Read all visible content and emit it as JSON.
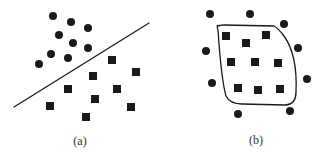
{
  "colors": {
    "ink": "#1a1a1a",
    "background": "#ffffff",
    "caption": "#333333"
  },
  "panels": [
    {
      "id": "a",
      "caption": "(a)",
      "caption_pos": [
        80,
        142
      ],
      "description": "Linearly separable classes: circles above a straight decision line, squares below",
      "separator": {
        "type": "line",
        "x1": 14,
        "y1": 107,
        "x2": 149,
        "y2": 23
      },
      "circles": [
        [
          53,
          16
        ],
        [
          71,
          22
        ],
        [
          88,
          28
        ],
        [
          59,
          35
        ],
        [
          73,
          43
        ],
        [
          88,
          48
        ],
        [
          51,
          54
        ],
        [
          68,
          58
        ],
        [
          39,
          64
        ]
      ],
      "squares": [
        [
          112,
          60
        ],
        [
          136,
          72
        ],
        [
          93,
          76
        ],
        [
          68,
          89
        ],
        [
          117,
          89
        ],
        [
          95,
          99
        ],
        [
          50,
          106
        ],
        [
          131,
          107
        ],
        [
          86,
          117
        ]
      ]
    },
    {
      "id": "b",
      "caption": "(b)",
      "caption_pos": [
        256,
        141
      ],
      "description": "Non-linearly separable classes: squares enclosed by a closed curved boundary, circles surrounding outside",
      "separator": {
        "type": "closed-curve",
        "path": "M 219 26 Q 216 24 218 30 C 220 60 222 82 226 96 Q 230 104 242 104 L 286 105 Q 296 104 296 92 C 297 70 294 50 284 36 Q 278 28 274 26 L 224 25 Q 219 25 219 26 Z"
      },
      "circles": [
        [
          210,
          14
        ],
        [
          250,
          14
        ],
        [
          284,
          24
        ],
        [
          206,
          51
        ],
        [
          298,
          48
        ],
        [
          212,
          83
        ],
        [
          307,
          79
        ],
        [
          238,
          114
        ],
        [
          290,
          111
        ]
      ],
      "squares": [
        [
          226,
          36
        ],
        [
          246,
          43
        ],
        [
          266,
          35
        ],
        [
          231,
          62
        ],
        [
          255,
          62
        ],
        [
          278,
          63
        ],
        [
          238,
          88
        ],
        [
          258,
          90
        ],
        [
          280,
          89
        ]
      ]
    }
  ],
  "marker": {
    "circle_radius": 4,
    "square_size": 8
  }
}
